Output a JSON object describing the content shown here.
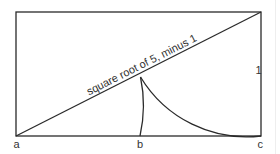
{
  "diagram": {
    "stroke_color": "#2a2a2a",
    "label_color": "#333333",
    "rectangle": {
      "x": 16,
      "y": 12,
      "width": 245,
      "height": 124
    },
    "diagonal_label": "square root of 5, minus 1",
    "side_label": "1",
    "points": [
      {
        "id": "a",
        "label": "a"
      },
      {
        "id": "b",
        "label": "b"
      },
      {
        "id": "c",
        "label": "c"
      }
    ]
  }
}
